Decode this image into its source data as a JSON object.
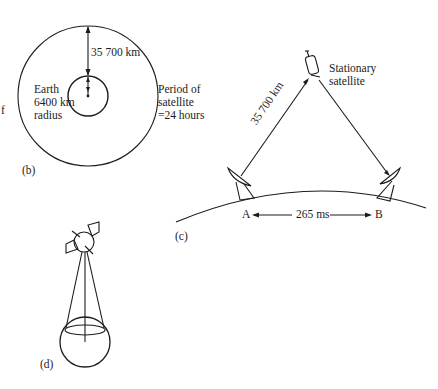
{
  "figure_b": {
    "caption": "(b)",
    "distance_label": "35 700 km",
    "earth_label": [
      "Earth",
      "6400 km",
      "radius"
    ],
    "period_label": [
      "Period of",
      "satellite",
      "=24 hours"
    ]
  },
  "figure_c": {
    "caption": "(c)",
    "satellite_label": [
      "Stationary",
      "satellite"
    ],
    "distance_label": "35 700 km",
    "station_a": "A",
    "station_b": "B",
    "delay_label": "265 ms"
  },
  "figure_d": {
    "caption": "(d)"
  },
  "margin_fragment": "f",
  "colors": {
    "ink": "#1c1c1c",
    "paper": "#ffffff"
  }
}
